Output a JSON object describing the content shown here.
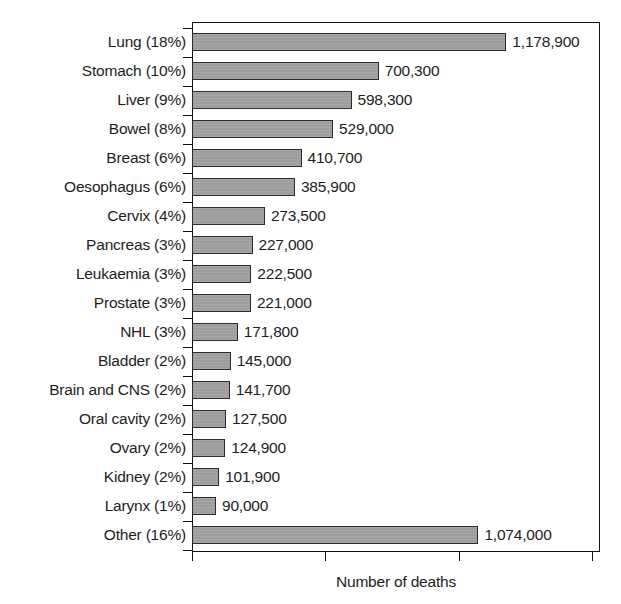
{
  "chart_data": {
    "type": "bar",
    "orientation": "horizontal",
    "title": "",
    "xlabel": "Number of deaths",
    "ylabel": "",
    "xlim": [
      0,
      1530000
    ],
    "grid": false,
    "legend": null,
    "xticks": [
      0,
      500000,
      1000000,
      1500000
    ],
    "xtick_labels": [
      "",
      "",
      "",
      ""
    ],
    "categories": [
      "Lung (18%)",
      "Stomach (10%)",
      "Liver (9%)",
      "Bowel (8%)",
      "Breast (6%)",
      "Oesophagus (6%)",
      "Cervix (4%)",
      "Pancreas (3%)",
      "Leukaemia (3%)",
      "Prostate (3%)",
      "NHL (3%)",
      "Bladder (2%)",
      "Brain and CNS (2%)",
      "Oral cavity (2%)",
      "Ovary (2%)",
      "Kidney (2%)",
      "Larynx (1%)",
      "Other (16%)"
    ],
    "values": [
      1178900,
      700300,
      598300,
      529000,
      410700,
      385900,
      273500,
      227000,
      222500,
      221000,
      171800,
      145000,
      141700,
      127500,
      124900,
      101900,
      90000,
      1074000
    ],
    "value_labels": [
      "1,178,900",
      "700,300",
      "598,300",
      "529,000",
      "410,700",
      "385,900",
      "273,500",
      "227,000",
      "222,500",
      "221,000",
      "171,800",
      "145,000",
      "141,700",
      "127,500",
      "124,900",
      "101,900",
      "90,000",
      "1,074,000"
    ],
    "percent_labels": [
      "18%",
      "10%",
      "9%",
      "8%",
      "6%",
      "6%",
      "4%",
      "3%",
      "3%",
      "3%",
      "3%",
      "2%",
      "2%",
      "2%",
      "2%",
      "2%",
      "1%",
      "16%"
    ],
    "colors": {
      "bar_fill": "#9d9d9d",
      "bar_border": "#2b2b2b",
      "axis": "#101010",
      "text": "#1d1d1d",
      "background": "#ffffff"
    }
  }
}
